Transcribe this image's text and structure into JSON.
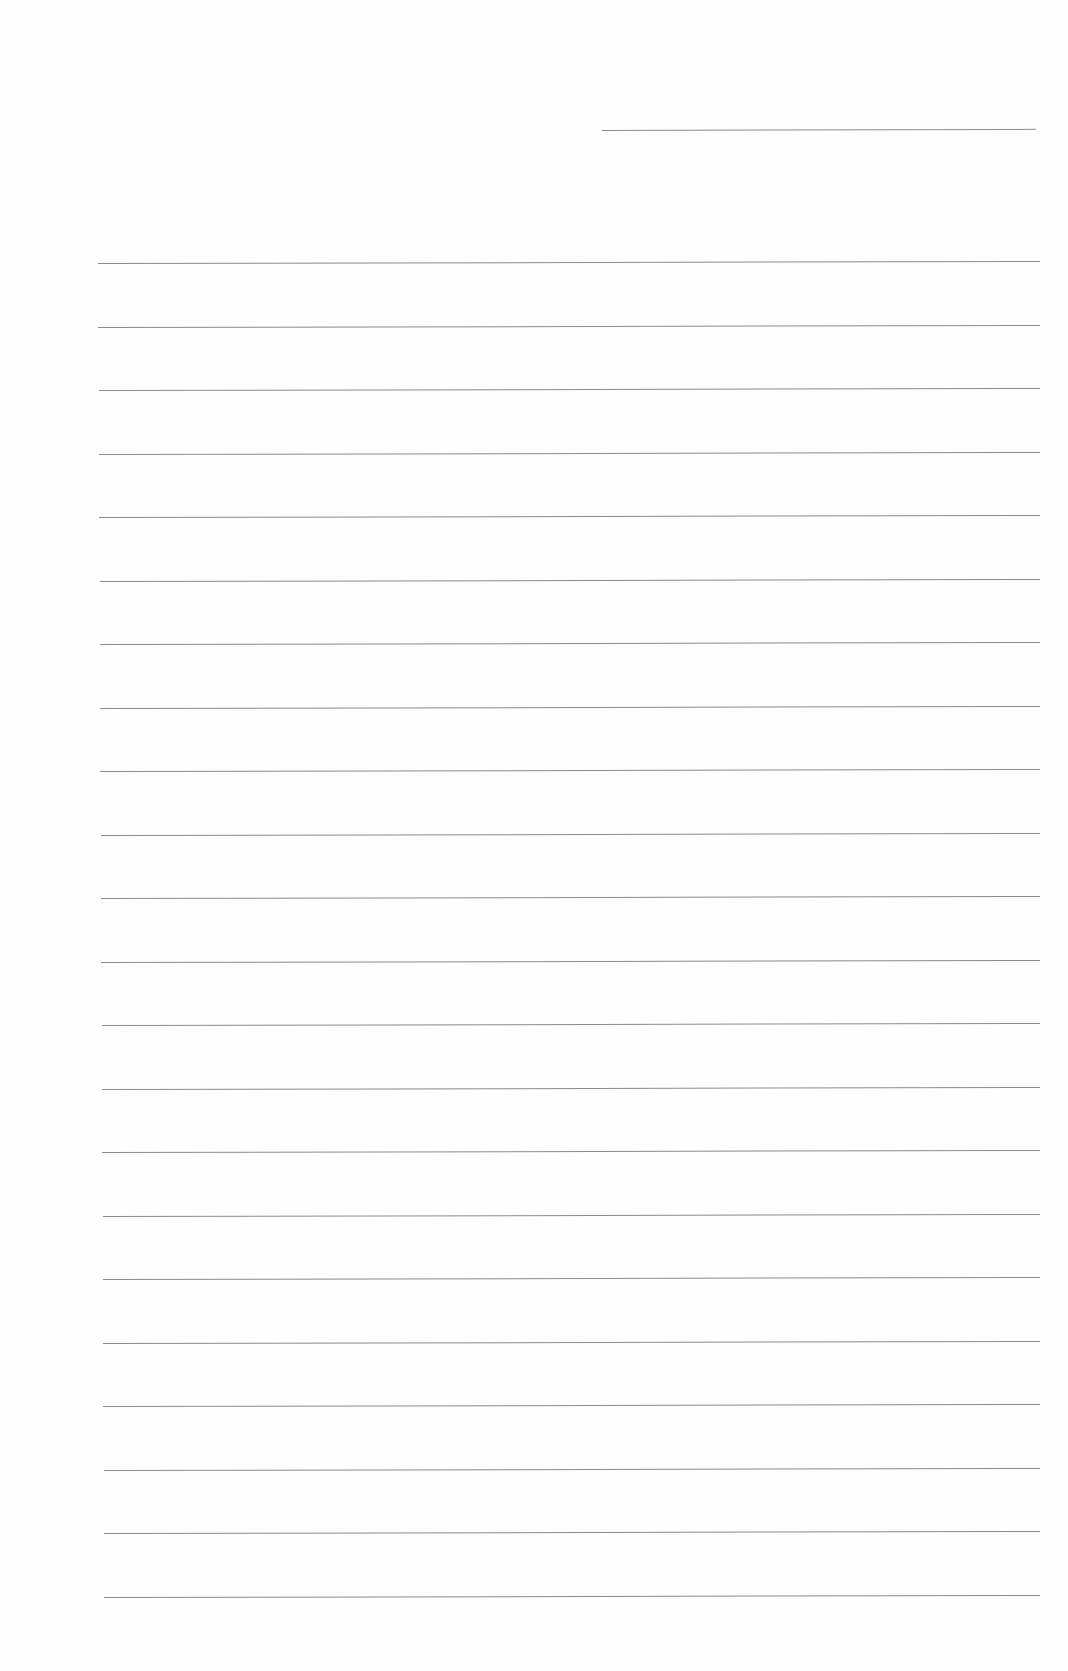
{
  "page": {
    "type": "lined-paper",
    "background_color": "#fefefe",
    "line_color": "#8c8c8c",
    "header_line": {
      "x": 602,
      "y": 130,
      "width": 434
    },
    "ruled_lines": {
      "count": 22,
      "first_y": 263,
      "spacing": 63.5,
      "x_start": 98,
      "x_end": 1040
    }
  }
}
